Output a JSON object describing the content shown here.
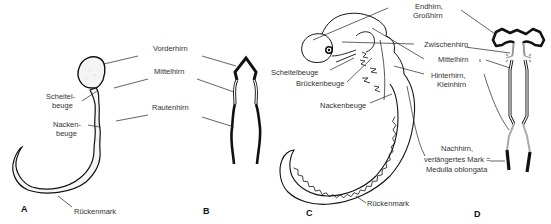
{
  "figure": {
    "panels": {
      "A": {
        "letter": "A",
        "labels": {
          "scheitelbeuge_1": "Scheitel-",
          "scheitelbeuge_2": "beuge",
          "nackenbeuge_1": "Nacken-",
          "nackenbeuge_2": "beuge",
          "rueckenmark": "Rückenmark"
        }
      },
      "AB_shared": {
        "vorderhirn": "Vorderhirn",
        "mittelhirn": "Mittelhirn",
        "rautenhirn": "Rautenhirn"
      },
      "B": {
        "letter": "B"
      },
      "C": {
        "letter": "C",
        "labels": {
          "scheitelbeuge": "Scheitelbeuge",
          "brueckenbeuge": "Brückenbeuge",
          "nackenbeuge": "Nackenbeuge",
          "rueckenmark": "Rückenmark"
        }
      },
      "CD_shared": {
        "endhirn_1": "Endhirn,",
        "endhirn_2": "Großhirn",
        "zwischenhirn": "Zwischenhirn",
        "mittelhirn": "Mittelhirn",
        "hinterhirn_1": "Hinterhirn,",
        "hinterhirn_2": "Kleinhirn",
        "nachhirn_1": "Nachhirn,",
        "nachhirn_2": "verlängertes Mark =",
        "nachhirn_3": "Medulla oblongata"
      },
      "D": {
        "letter": "D"
      }
    }
  }
}
